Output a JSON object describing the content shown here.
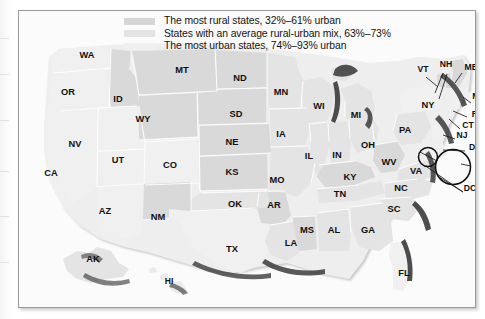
{
  "figure": {
    "type": "choropleth-map",
    "region": "United States",
    "title": ""
  },
  "legend": {
    "position": "top-center",
    "items": [
      {
        "swatch_color": "#d6d6d6",
        "label": "The most rural states, 32%–61% urban"
      },
      {
        "swatch_color": "#e4e4e4",
        "label": "States with an average rural-urban mix, 63%–73%"
      },
      {
        "swatch_color": "#f0f0f0",
        "label": "The most urban states, 74%–93% urban"
      }
    ]
  },
  "colors": {
    "most_rural": "#d6d6d6",
    "average_mix": "#e4e4e4",
    "most_urban": "#f0f0f0",
    "state_border": "#ffffff",
    "coastline": "#2f2f2f",
    "label_text": "#101010",
    "frame_border": "#9a9a9a",
    "figure_background": "#fbfbfb"
  },
  "map": {
    "labels": [
      {
        "id": "WA",
        "text": "WA",
        "x": 68,
        "y": 47,
        "class": "most_urban"
      },
      {
        "id": "OR",
        "text": "OR",
        "x": 49,
        "y": 84,
        "class": "most_urban"
      },
      {
        "id": "ID",
        "text": "ID",
        "x": 99,
        "y": 91,
        "class": "most_rural"
      },
      {
        "id": "MT",
        "text": "MT",
        "x": 163,
        "y": 62,
        "class": "most_rural"
      },
      {
        "id": "ND",
        "text": "ND",
        "x": 221,
        "y": 70,
        "class": "most_rural"
      },
      {
        "id": "MN",
        "text": "MN",
        "x": 262,
        "y": 84,
        "class": "average_mix"
      },
      {
        "id": "WI",
        "text": "WI",
        "x": 300,
        "y": 98,
        "class": "average_mix"
      },
      {
        "id": "MI",
        "text": "MI",
        "x": 337,
        "y": 107,
        "class": "average_mix"
      },
      {
        "id": "NV",
        "text": "NV",
        "x": 56,
        "y": 136,
        "class": "most_urban"
      },
      {
        "id": "WY",
        "text": "WY",
        "x": 124,
        "y": 111,
        "class": "most_rural"
      },
      {
        "id": "SD",
        "text": "SD",
        "x": 217,
        "y": 106,
        "class": "most_rural"
      },
      {
        "id": "IA",
        "text": "IA",
        "x": 262,
        "y": 126,
        "class": "average_mix"
      },
      {
        "id": "UT",
        "text": "UT",
        "x": 99,
        "y": 152,
        "class": "most_urban"
      },
      {
        "id": "CO",
        "text": "CO",
        "x": 151,
        "y": 157,
        "class": "most_urban"
      },
      {
        "id": "NE",
        "text": "NE",
        "x": 213,
        "y": 134,
        "class": "most_rural"
      },
      {
        "id": "IL",
        "text": "IL",
        "x": 290,
        "y": 148,
        "class": "average_mix"
      },
      {
        "id": "IN",
        "text": "IN",
        "x": 318,
        "y": 147,
        "class": "average_mix"
      },
      {
        "id": "OH",
        "text": "OH",
        "x": 349,
        "y": 137,
        "class": "average_mix"
      },
      {
        "id": "CA",
        "text": "CA",
        "x": 32,
        "y": 165,
        "class": "most_urban"
      },
      {
        "id": "KS",
        "text": "KS",
        "x": 213,
        "y": 164,
        "class": "most_rural"
      },
      {
        "id": "MO",
        "text": "MO",
        "x": 258,
        "y": 172,
        "class": "average_mix"
      },
      {
        "id": "KY",
        "text": "KY",
        "x": 331,
        "y": 169,
        "class": "most_rural"
      },
      {
        "id": "WV",
        "text": "WV",
        "x": 370,
        "y": 154,
        "class": "most_rural"
      },
      {
        "id": "VA",
        "text": "VA",
        "x": 397,
        "y": 163,
        "class": "average_mix"
      },
      {
        "id": "AZ",
        "text": "AZ",
        "x": 86,
        "y": 203,
        "class": "most_urban"
      },
      {
        "id": "NM",
        "text": "NM",
        "x": 139,
        "y": 209,
        "class": "most_rural"
      },
      {
        "id": "OK",
        "text": "OK",
        "x": 216,
        "y": 196,
        "class": "average_mix"
      },
      {
        "id": "AR",
        "text": "AR",
        "x": 255,
        "y": 197,
        "class": "most_rural"
      },
      {
        "id": "TN",
        "text": "TN",
        "x": 321,
        "y": 186,
        "class": "average_mix"
      },
      {
        "id": "NC",
        "text": "NC",
        "x": 382,
        "y": 180,
        "class": "average_mix"
      },
      {
        "id": "SC",
        "text": "SC",
        "x": 375,
        "y": 201,
        "class": "average_mix"
      },
      {
        "id": "MS",
        "text": "MS",
        "x": 288,
        "y": 222,
        "class": "most_rural"
      },
      {
        "id": "AL",
        "text": "AL",
        "x": 315,
        "y": 222,
        "class": "average_mix"
      },
      {
        "id": "GA",
        "text": "GA",
        "x": 349,
        "y": 222,
        "class": "average_mix"
      },
      {
        "id": "LA",
        "text": "LA",
        "x": 272,
        "y": 235,
        "class": "average_mix"
      },
      {
        "id": "TX",
        "text": "TX",
        "x": 213,
        "y": 241,
        "class": "most_urban"
      },
      {
        "id": "FL",
        "text": "FL",
        "x": 385,
        "y": 265,
        "class": "most_urban"
      },
      {
        "id": "AK",
        "text": "AK",
        "x": 74,
        "y": 251,
        "class": "average_mix"
      },
      {
        "id": "HI",
        "text": "HI",
        "x": 150,
        "y": 273,
        "class": "most_urban"
      },
      {
        "id": "PA",
        "text": "PA",
        "x": 386,
        "y": 122,
        "class": "average_mix"
      },
      {
        "id": "NY",
        "text": "NY",
        "x": 409,
        "y": 97,
        "class": "most_urban"
      },
      {
        "id": "VT",
        "text": "VT",
        "x": 404,
        "y": 61,
        "class": "most_rural"
      },
      {
        "id": "NH",
        "text": "NH",
        "x": 427,
        "y": 56,
        "class": "most_rural"
      },
      {
        "id": "ME",
        "text": "ME",
        "x": 452,
        "y": 59,
        "class": "most_rural"
      },
      {
        "id": "MA",
        "text": "MA",
        "x": 460,
        "y": 88,
        "class": "most_urban"
      },
      {
        "id": "RI",
        "text": "RI",
        "x": 457,
        "y": 106,
        "class": "most_urban"
      },
      {
        "id": "CT",
        "text": "CT",
        "x": 449,
        "y": 117,
        "class": "most_urban"
      },
      {
        "id": "NJ",
        "text": "NJ",
        "x": 443,
        "y": 127,
        "class": "most_urban"
      },
      {
        "id": "DE",
        "text": "DE",
        "x": 456,
        "y": 139,
        "class": "most_urban"
      },
      {
        "id": "MD",
        "text": "MD",
        "x": 464,
        "y": 155,
        "class": "most_urban"
      },
      {
        "id": "DC",
        "text": "DC",
        "x": 451,
        "y": 180,
        "class": "most_urban"
      }
    ],
    "callouts": [
      {
        "id": "dc-circle-small",
        "cx": 409,
        "cy": 146,
        "r": 9.5
      },
      {
        "id": "md-circle-large",
        "cx": 434,
        "cy": 156,
        "r": 17.5
      }
    ],
    "inset_labels": [
      "AK",
      "HI"
    ]
  }
}
